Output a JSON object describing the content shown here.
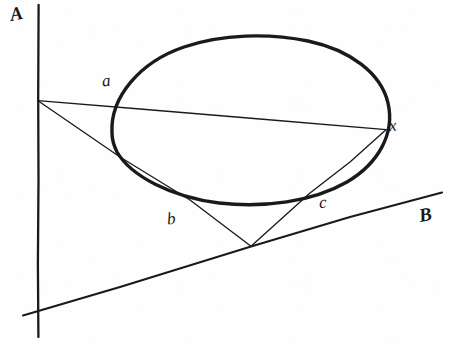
{
  "figure": {
    "background_color": "#fefefe",
    "ink_color": "#1a1a1a",
    "width": 452,
    "height": 358,
    "labels": [
      {
        "id": "label-A",
        "text": "A",
        "x": 10,
        "y": 4,
        "style": "capital",
        "describes": "vertical-line-A"
      },
      {
        "id": "label-B",
        "text": "B",
        "x": 419,
        "y": 205,
        "style": "capital",
        "describes": "slanted-line-B"
      },
      {
        "id": "label-a",
        "text": "a",
        "x": 102,
        "y": 72,
        "style": "lowercase",
        "describes": "tangency-point-a"
      },
      {
        "id": "label-b",
        "text": "b",
        "x": 167,
        "y": 210,
        "style": "lowercase",
        "describes": "tangency-point-b"
      },
      {
        "id": "label-c",
        "text": "c",
        "x": 319,
        "y": 194,
        "style": "lowercase",
        "describes": "tangency-point-c"
      },
      {
        "id": "label-x",
        "text": "x",
        "x": 389,
        "y": 117,
        "style": "lowercase",
        "describes": "tangency-point-x"
      }
    ],
    "points": {
      "pole_left": {
        "x": 38,
        "y": 101,
        "name": "left-pole-on-line-A"
      },
      "apex_lower": {
        "x": 251,
        "y": 246,
        "name": "lower-pole-on-line-B"
      },
      "a": {
        "x": 119,
        "y": 105
      },
      "b": {
        "x": 190,
        "y": 200
      },
      "c": {
        "x": 310,
        "y": 192
      },
      "x": {
        "x": 386,
        "y": 130
      }
    },
    "conic": {
      "name": "ellipse",
      "center_x": 249,
      "center_y": 120,
      "radius_x": 140,
      "radius_y": 82,
      "rotation_deg": -3,
      "stroke_width": 3.4
    },
    "line_A": {
      "name": "vertical-line-A",
      "x1": 38,
      "y1": 5,
      "x2": 38,
      "y2": 337,
      "stroke_width": 2.3
    },
    "line_B": {
      "name": "slanted-line-B",
      "x1": 23,
      "y1": 315,
      "x2": 442,
      "y2": 193,
      "stroke_width": 2.1
    },
    "chords": [
      {
        "name": "chord-pole-to-x",
        "x1": 38,
        "y1": 101,
        "x2": 386,
        "y2": 130
      },
      {
        "name": "chord-pole-to-apex",
        "x1": 38,
        "y1": 101,
        "x2": 251,
        "y2": 246
      },
      {
        "name": "chord-apex-to-x",
        "x1": 251,
        "y1": 246,
        "x2": 386,
        "y2": 130
      }
    ]
  }
}
